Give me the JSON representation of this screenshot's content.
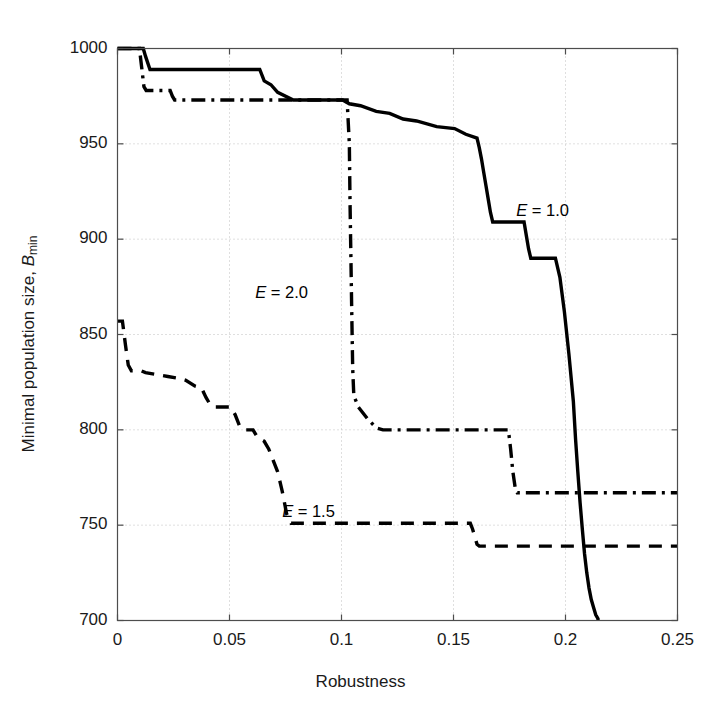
{
  "chart_data": {
    "type": "line",
    "title": "",
    "xlabel": "Robustness",
    "ylabel_plain": "Minimal population size, Bmin",
    "ylabel_main": "Minimal population size, ",
    "ylabel_italic": "B",
    "ylabel_sub": "min",
    "xlim": [
      0,
      0.25
    ],
    "ylim": [
      700,
      1000
    ],
    "xticks": [
      0,
      0.05,
      0.1,
      0.15,
      0.2,
      0.25
    ],
    "xtick_labels": [
      "0",
      "0.05",
      "0.1",
      "0.15",
      "0.2",
      "0.25"
    ],
    "yticks": [
      700,
      750,
      800,
      850,
      900,
      950,
      1000
    ],
    "ytick_labels": [
      "700",
      "750",
      "800",
      "850",
      "900",
      "950",
      "1000"
    ],
    "grid": true,
    "grid_style": "dotted",
    "legend_position": "inline-annotations",
    "line_color": "#000000",
    "grid_color": "#bfbfbf",
    "axis_color": "#4d4d4d",
    "background": "#ffffff",
    "series": [
      {
        "name": "E = 1.0",
        "style": "solid",
        "label_x": 0.178,
        "label_y": 915,
        "points": [
          [
            0.0,
            1000
          ],
          [
            0.0115,
            1000
          ],
          [
            0.0125,
            996
          ],
          [
            0.0145,
            989
          ],
          [
            0.0635,
            989
          ],
          [
            0.0655,
            983
          ],
          [
            0.0685,
            981
          ],
          [
            0.0715,
            977
          ],
          [
            0.0785,
            973
          ],
          [
            0.1005,
            973
          ],
          [
            0.1035,
            971
          ],
          [
            0.1085,
            970
          ],
          [
            0.1155,
            967
          ],
          [
            0.1215,
            966
          ],
          [
            0.1275,
            963
          ],
          [
            0.1335,
            962
          ],
          [
            0.1425,
            959
          ],
          [
            0.1505,
            958
          ],
          [
            0.1555,
            955
          ],
          [
            0.1605,
            953
          ],
          [
            0.1615,
            948
          ],
          [
            0.1625,
            942
          ],
          [
            0.1635,
            935
          ],
          [
            0.1645,
            928
          ],
          [
            0.1655,
            921
          ],
          [
            0.1665,
            914
          ],
          [
            0.1675,
            909
          ],
          [
            0.1815,
            909
          ],
          [
            0.1825,
            902
          ],
          [
            0.1835,
            895
          ],
          [
            0.1845,
            890
          ],
          [
            0.1955,
            890
          ],
          [
            0.1975,
            880
          ],
          [
            0.1995,
            862
          ],
          [
            0.2015,
            840
          ],
          [
            0.2035,
            815
          ],
          [
            0.2045,
            795
          ],
          [
            0.2055,
            778
          ],
          [
            0.2065,
            762
          ],
          [
            0.2075,
            748
          ],
          [
            0.2085,
            735
          ],
          [
            0.2095,
            725
          ],
          [
            0.2105,
            717
          ],
          [
            0.2115,
            711
          ],
          [
            0.2125,
            707
          ],
          [
            0.2135,
            703
          ],
          [
            0.2145,
            701
          ],
          [
            0.2145,
            700
          ]
        ]
      },
      {
        "name": "E = 1.5",
        "style": "dashed",
        "label_x": 0.0735,
        "label_y": 757,
        "points": [
          [
            0.0,
            857
          ],
          [
            0.0022,
            857
          ],
          [
            0.0035,
            845
          ],
          [
            0.0048,
            834
          ],
          [
            0.0062,
            831
          ],
          [
            0.0105,
            831
          ],
          [
            0.0125,
            830
          ],
          [
            0.0175,
            829
          ],
          [
            0.0225,
            828
          ],
          [
            0.0275,
            827
          ],
          [
            0.0305,
            826
          ],
          [
            0.0345,
            823
          ],
          [
            0.0375,
            822
          ],
          [
            0.0395,
            817
          ],
          [
            0.0415,
            813
          ],
          [
            0.0435,
            812
          ],
          [
            0.0505,
            812
          ],
          [
            0.0525,
            808
          ],
          [
            0.0545,
            802
          ],
          [
            0.0565,
            800
          ],
          [
            0.0605,
            800
          ],
          [
            0.0625,
            796
          ],
          [
            0.0655,
            794
          ],
          [
            0.0675,
            790
          ],
          [
            0.0695,
            784
          ],
          [
            0.0715,
            778
          ],
          [
            0.0725,
            773
          ],
          [
            0.0735,
            768
          ],
          [
            0.0745,
            762
          ],
          [
            0.0755,
            756
          ],
          [
            0.0775,
            751
          ],
          [
            0.0795,
            751
          ],
          [
            0.1575,
            751
          ],
          [
            0.1585,
            748
          ],
          [
            0.1595,
            744
          ],
          [
            0.1605,
            740
          ],
          [
            0.1615,
            739
          ],
          [
            0.25,
            739
          ]
        ]
      },
      {
        "name": "E = 2.0",
        "style": "dashdot",
        "label_x": 0.0615,
        "label_y": 872,
        "points": [
          [
            0.0,
            1000
          ],
          [
            0.0098,
            1000
          ],
          [
            0.0108,
            990
          ],
          [
            0.0118,
            980
          ],
          [
            0.0128,
            978
          ],
          [
            0.0235,
            978
          ],
          [
            0.0245,
            975
          ],
          [
            0.0255,
            973
          ],
          [
            0.1025,
            973
          ],
          [
            0.1035,
            950
          ],
          [
            0.1038,
            920
          ],
          [
            0.1042,
            890
          ],
          [
            0.1046,
            860
          ],
          [
            0.105,
            832
          ],
          [
            0.1055,
            818
          ],
          [
            0.1075,
            812
          ],
          [
            0.1115,
            806
          ],
          [
            0.1155,
            801
          ],
          [
            0.1185,
            800
          ],
          [
            0.1745,
            800
          ],
          [
            0.1755,
            790
          ],
          [
            0.1765,
            778
          ],
          [
            0.1775,
            770
          ],
          [
            0.1785,
            767
          ],
          [
            0.25,
            767
          ]
        ]
      }
    ]
  },
  "axes": {
    "x_title": "Robustness",
    "y_title_main": "Minimal population size, ",
    "y_title_var": "B",
    "y_title_sub": "min"
  },
  "annotations": [
    {
      "text": "E = 1.0",
      "var": "E",
      "eq": " = 1.0"
    },
    {
      "text": "E = 1.5",
      "var": "E",
      "eq": " = 1.5"
    },
    {
      "text": "E = 2.0",
      "var": "E",
      "eq": " = 2.0"
    }
  ]
}
